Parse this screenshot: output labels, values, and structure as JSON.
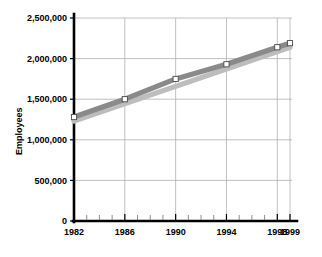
{
  "chart_data": {
    "type": "line",
    "title": "",
    "xlabel": "",
    "ylabel": "Employees",
    "ylim": [
      0,
      2500000
    ],
    "xlim": [
      1982,
      1999
    ],
    "grid": true,
    "legend": "none",
    "y_ticks": [
      0,
      500000,
      1000000,
      1500000,
      2000000,
      2500000
    ],
    "y_tick_labels": [
      "0",
      "500,000",
      "1,000,000",
      "1,500,000",
      "2,000,000",
      "2,500,000"
    ],
    "x_ticks": [
      1982,
      1986,
      1990,
      1994,
      1998,
      1999
    ],
    "x_tick_labels": [
      "1982",
      "1986",
      "1990",
      "1994",
      "1998",
      "1999"
    ],
    "x_minor_ticks": [
      1983,
      1984,
      1985,
      1987,
      1988,
      1989,
      1991,
      1992,
      1993,
      1995,
      1996,
      1997
    ],
    "series": [
      {
        "name": "employees-dark",
        "color": "#8a8a8a",
        "markers": true,
        "x": [
          1982,
          1986,
          1990,
          1994,
          1998,
          1999
        ],
        "values": [
          1280000,
          1500000,
          1750000,
          1930000,
          2140000,
          2190000
        ]
      },
      {
        "name": "employees-light",
        "color": "#bdbdbd",
        "markers": false,
        "x": [
          1982,
          1999
        ],
        "values": [
          1230000,
          2140000
        ]
      }
    ]
  },
  "axis": {
    "y_title": "Employees"
  },
  "colors": {
    "series_dark": "#8a8a8a",
    "series_light": "#bdbdbd",
    "grid": "#b0b0b0",
    "axis": "#000000",
    "marker_fill": "#ffffff"
  }
}
